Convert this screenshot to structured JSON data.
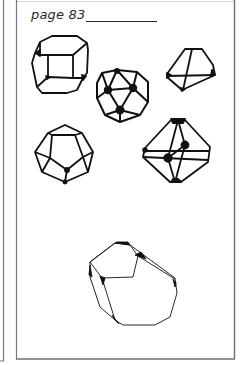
{
  "page": {
    "label": "page 83",
    "underline": true
  },
  "colors": {
    "ink": "#111111",
    "frame": "#6f6f6f",
    "paper": "#ffffff"
  },
  "figures": [
    {
      "id": "truncated-cube",
      "description": "truncated cube line drawing"
    },
    {
      "id": "icosidodecahedron",
      "description": "rounded polyhedron with dark vertices"
    },
    {
      "id": "truncated-tetrahedron",
      "description": "small polyhedron, top right"
    },
    {
      "id": "dodecahedron",
      "description": "pentagonal dodecahedron line drawing"
    },
    {
      "id": "cuboctahedron",
      "description": "polyhedron with dark vertex nodes"
    },
    {
      "id": "truncated-octahedron",
      "description": "large thin-line polyhedron, bottom"
    }
  ]
}
